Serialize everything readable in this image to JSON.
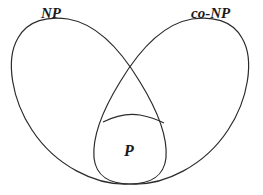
{
  "diagram": {
    "type": "venn",
    "sets": [
      {
        "id": "np",
        "label": "NP"
      },
      {
        "id": "conp",
        "label": "co-NP"
      },
      {
        "id": "p",
        "label": "P"
      }
    ],
    "relations": [
      {
        "from": "p",
        "to": "np",
        "type": "subset"
      },
      {
        "from": "p",
        "to": "conp",
        "type": "subset"
      },
      {
        "from": "np",
        "to": "conp",
        "type": "overlap"
      }
    ],
    "stroke_color": "#2b2b2b",
    "background_color": "#ffffff"
  }
}
